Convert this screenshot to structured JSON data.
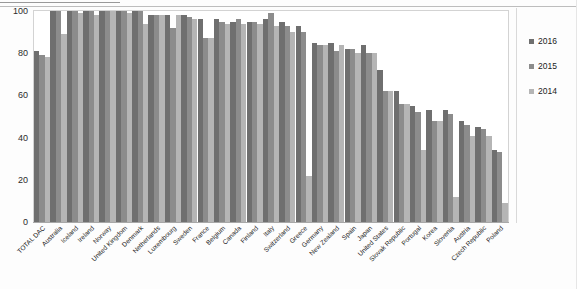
{
  "chart_data": {
    "type": "bar",
    "title": "",
    "xlabel": "",
    "ylabel": "",
    "ylim": [
      0,
      100
    ],
    "yticks": [
      0,
      20,
      40,
      60,
      80,
      100
    ],
    "grid": false,
    "legend_position": "right",
    "categories": [
      "TOTAL DAC",
      "Australia",
      "Iceland",
      "Ireland",
      "Norway",
      "United Kingdom",
      "Denmark",
      "Netherlands",
      "Luxembourg",
      "Sweden",
      "France",
      "Belgium",
      "Canada",
      "Finland",
      "Italy",
      "Switzerland",
      "Greece",
      "Germany",
      "New Zealand",
      "Spain",
      "Japan",
      "United States",
      "Slovak Republic",
      "Portugal",
      "Korea",
      "Slovenia",
      "Austria",
      "Czech Republic",
      "Poland"
    ],
    "series": [
      {
        "name": "2016",
        "color": "#6f6f6f",
        "values": [
          81,
          100,
          100,
          100,
          100,
          100,
          100,
          98,
          98,
          98,
          96,
          96,
          95,
          95,
          96,
          95,
          93,
          85,
          85,
          82,
          84,
          72,
          62,
          55,
          53,
          53,
          48,
          45,
          34
        ]
      },
      {
        "name": "2015",
        "color": "#8c8c8c",
        "values": [
          79,
          100,
          100,
          100,
          100,
          100,
          100,
          98,
          92,
          97,
          87,
          95,
          96,
          95,
          99,
          93,
          90,
          84,
          81,
          82,
          80,
          62,
          56,
          52,
          48,
          51,
          46,
          44,
          33
        ]
      },
      {
        "name": "2014",
        "color": "#b5b5b5",
        "values": [
          78,
          89,
          99,
          98,
          100,
          99,
          94,
          98,
          98,
          96,
          87,
          94,
          94,
          94,
          93,
          90,
          22,
          84,
          84,
          80,
          80,
          62,
          56,
          34,
          48,
          12,
          41,
          41,
          9
        ]
      }
    ]
  },
  "legend": {
    "items": [
      {
        "label": "2016",
        "key": "y2016"
      },
      {
        "label": "2015",
        "key": "y2015"
      },
      {
        "label": "2014",
        "key": "y2014"
      }
    ]
  },
  "axis": {
    "y_ticks": [
      "100",
      "80",
      "60",
      "40",
      "20",
      "0"
    ]
  }
}
